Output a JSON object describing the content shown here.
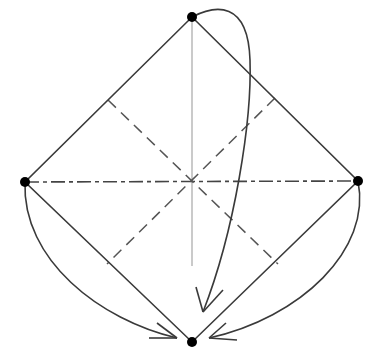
{
  "diagram": {
    "title": "Origami folding diagram: square base with corners folded to bottom point",
    "colors": {
      "background": "#ffffff",
      "edge": "#3a3a3a",
      "crease_valley": "#555555",
      "crease_mountain": "#444444",
      "centerline": "#bdbdbd",
      "arrow": "#3a3a3a",
      "point": "#000000"
    },
    "points": [
      {
        "id": "top",
        "x": 192,
        "y": 17
      },
      {
        "id": "left",
        "x": 25,
        "y": 182
      },
      {
        "id": "right",
        "x": 358,
        "y": 181
      },
      {
        "id": "bottom",
        "x": 192,
        "y": 342
      }
    ],
    "edges": [
      {
        "from": "top",
        "to": "right"
      },
      {
        "from": "right",
        "to": "bottom"
      },
      {
        "from": "bottom",
        "to": "left"
      },
      {
        "from": "left",
        "to": "top"
      }
    ],
    "creases": [
      {
        "type": "mountain-dash-dot",
        "from": [
          25,
          182
        ],
        "to": [
          358,
          181
        ]
      },
      {
        "type": "valley-dash",
        "from": [
          108,
          100
        ],
        "to": [
          278,
          264
        ]
      },
      {
        "type": "valley-dash",
        "from": [
          275,
          98
        ],
        "to": [
          107,
          264
        ]
      },
      {
        "type": "reference-line",
        "from": [
          192,
          17
        ],
        "to": [
          192,
          266
        ]
      }
    ],
    "arrows": [
      {
        "id": "top-to-bottom",
        "description": "fold top corner down to bottom"
      },
      {
        "id": "left-to-bottom",
        "description": "fold left corner down to bottom"
      },
      {
        "id": "right-to-bottom",
        "description": "fold right corner down to bottom"
      }
    ]
  }
}
